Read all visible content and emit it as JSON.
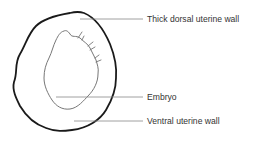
{
  "diagram": {
    "type": "anatomical-section",
    "labels": [
      {
        "id": "dorsal-wall",
        "text": "Thick dorsal uterine wall",
        "x": 147,
        "y": 14
      },
      {
        "id": "embryo",
        "text": "Embryo",
        "x": 147,
        "y": 92
      },
      {
        "id": "ventral-wall",
        "text": "Ventral uterine wall",
        "x": 147,
        "y": 116
      }
    ],
    "colors": {
      "outer_wall": "#1a1a1a",
      "embryo_outline": "#777777",
      "leader_lines": "#888888",
      "text": "#333333"
    }
  }
}
